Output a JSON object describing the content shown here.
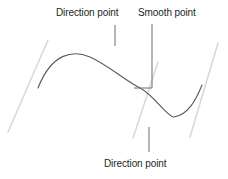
{
  "figure": {
    "width": 228,
    "height": 179,
    "background_color": "#ffffff"
  },
  "labels": {
    "direction_point_top": "Direction point",
    "smooth_point": "Smooth point",
    "direction_point_bottom": "Direction point"
  },
  "colors": {
    "text": "#231f20",
    "curve": "#58595b",
    "leader_line": "#6d6e71",
    "handle_line": "#d8d9da"
  },
  "graphics": {
    "curve": {
      "name": "bezier-curve",
      "path": "M 38 88 C 52 52 74 50 90 57 C 108 65 124 80 140 88 C 154 95 168 118 174 117 C 188 115 196 100 202 85"
    },
    "handles": [
      {
        "name": "direction-handle-left",
        "x1": 48,
        "y1": 40,
        "x2": 8,
        "y2": 132
      },
      {
        "name": "direction-handle-center",
        "x1": 158,
        "y1": 62,
        "x2": 133,
        "y2": 138
      },
      {
        "name": "direction-handle-right",
        "x1": 218,
        "y1": 43,
        "x2": 190,
        "y2": 137
      }
    ],
    "leaders": [
      {
        "name": "leader-direction-top",
        "path": "M 115 25 L 115 46"
      },
      {
        "name": "leader-smooth-bracket",
        "path": "M 152 24 L 152 88 L 134 88"
      },
      {
        "name": "leader-direction-bottom",
        "path": "M 149 127 L 149 152"
      }
    ]
  }
}
